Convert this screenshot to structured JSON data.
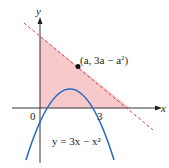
{
  "figure": {
    "axes": {
      "x_label": "x",
      "y_label": "y",
      "origin_label": "0",
      "x_tick_label": "3"
    },
    "curve": {
      "equation_label": "y = 3x − x²",
      "color": "#2a6ebb"
    },
    "tangent_line": {
      "color": "#e0393e",
      "style": "dashed"
    },
    "point": {
      "label": "(a, 3a − a²)",
      "label_prefix": "(a, 3a − a",
      "label_exp": "2",
      "label_suffix": ")"
    },
    "shaded_region": {
      "color": "#f7c9cb"
    }
  }
}
